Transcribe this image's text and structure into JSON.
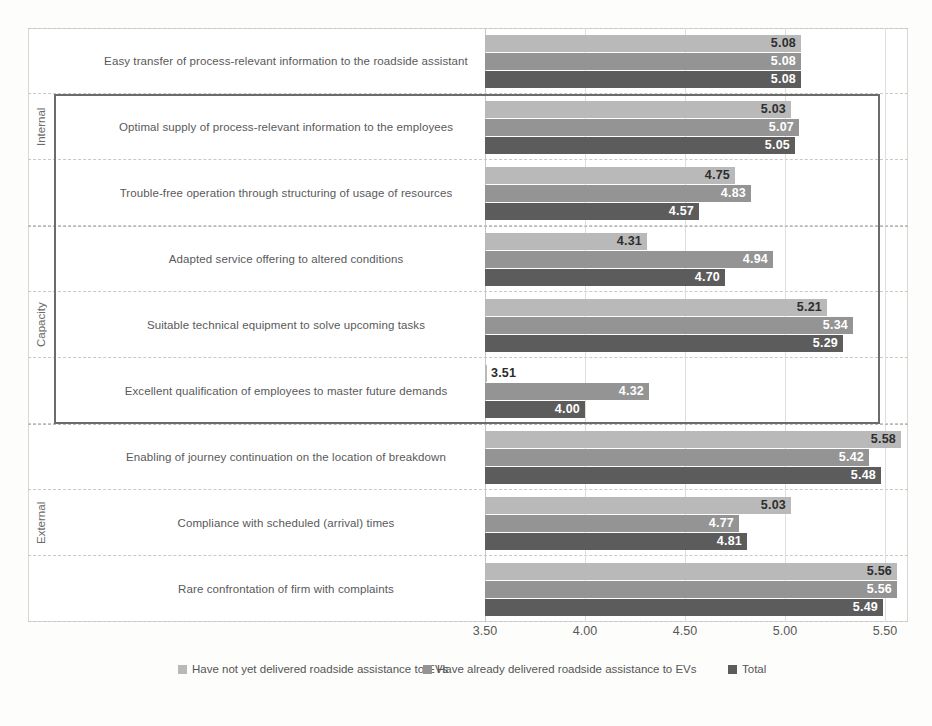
{
  "chart_data": {
    "type": "bar",
    "orientation": "horizontal",
    "title": "",
    "xlabel": "",
    "ylabel": "",
    "xlim": [
      3.5,
      5.5
    ],
    "xticks": [
      "3.50",
      "4.00",
      "4.50",
      "5.00",
      "5.50"
    ],
    "xtick_values": [
      3.5,
      4.0,
      4.5,
      5.0,
      5.5
    ],
    "grid": true,
    "legend_position": "bottom",
    "series": [
      {
        "name": "Have not yet delivered roadside assistance to EVs",
        "color": "#b9b9b9",
        "values": [
          5.08,
          5.03,
          4.75,
          4.31,
          5.21,
          3.51,
          5.58,
          5.03,
          5.56
        ]
      },
      {
        "name": "Have already delivered roadside assistance to EVs",
        "color": "#949494",
        "values": [
          5.08,
          5.07,
          4.83,
          4.94,
          5.34,
          4.32,
          5.42,
          4.77,
          5.56
        ]
      },
      {
        "name": "Total",
        "color": "#5c5c5c",
        "values": [
          5.08,
          5.05,
          4.57,
          4.7,
          5.29,
          4.0,
          5.48,
          4.81,
          5.49
        ]
      }
    ],
    "categories": [
      "Easy transfer of process-relevant information to the roadside assistant",
      "Optimal supply of process-relevant information to the employees",
      "Trouble-free operation through structuring of usage of resources",
      "Adapted service offering to altered conditions",
      "Suitable technical equipment to solve upcoming tasks",
      "Excellent qualification of employees to master future demands",
      "Enabling of journey continuation on the location of breakdown",
      "Compliance with scheduled (arrival) times",
      "Rare confrontation of firm with complaints"
    ],
    "group_labels": [
      {
        "label": "Internal",
        "from": 0,
        "to": 2
      },
      {
        "label": "Capacity",
        "from": 3,
        "to": 5
      },
      {
        "label": "External",
        "from": 6,
        "to": 8
      }
    ],
    "highlight": {
      "from_row": 1,
      "to_row": 5,
      "color": "#6b6b6b"
    }
  },
  "legend": {
    "items": [
      "Have not yet delivered roadside assistance to EVs",
      "Have already delivered roadside assistance to EVs",
      "Total"
    ]
  }
}
